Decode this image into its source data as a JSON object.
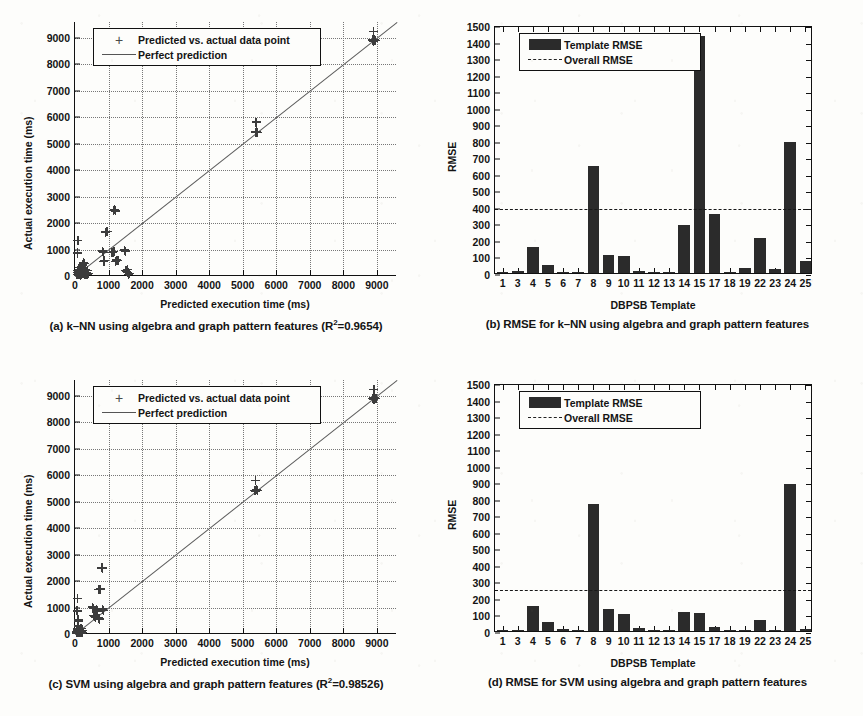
{
  "figure": {
    "panels": [
      {
        "id": "a",
        "caption_prefix": "(a) k–NN using algebra and graph pattern features (R",
        "caption_sup": "2",
        "caption_suffix": "=0.9654)"
      },
      {
        "id": "b",
        "caption": "(b) RMSE for k–NN using algebra and graph pattern features"
      },
      {
        "id": "c",
        "caption_prefix": "(c) SVM using algebra and graph pattern features (R",
        "caption_sup": "2",
        "caption_suffix": "=0.98526)"
      },
      {
        "id": "d",
        "caption": "(d) RMSE for SVM using algebra and graph pattern features"
      }
    ]
  },
  "chart_data": [
    {
      "panel": "a",
      "type": "scatter",
      "title": "k-NN using algebra and graph pattern features",
      "xlabel": "Predicted execution time (ms)",
      "ylabel": "Actual execution time (ms)",
      "xlim": [
        0,
        9600
      ],
      "ylim": [
        0,
        9600
      ],
      "xticks": [
        0,
        1000,
        2000,
        3000,
        4000,
        5000,
        6000,
        7000,
        8000,
        9000
      ],
      "yticks": [
        0,
        1000,
        2000,
        3000,
        4000,
        5000,
        6000,
        7000,
        8000,
        9000
      ],
      "grid": true,
      "r_squared": 0.9654,
      "legend_position": "upper-left",
      "legend": [
        {
          "label": "Predicted vs. actual data point",
          "marker": "plus"
        },
        {
          "label": "Perfect prediction",
          "marker": "line"
        }
      ],
      "reference_line": {
        "name": "Perfect prediction",
        "slope": 1,
        "intercept": 0
      },
      "points": [
        [
          60,
          60
        ],
        [
          70,
          120
        ],
        [
          80,
          200
        ],
        [
          90,
          90
        ],
        [
          100,
          160
        ],
        [
          110,
          40
        ],
        [
          120,
          250
        ],
        [
          130,
          60
        ],
        [
          140,
          330
        ],
        [
          150,
          110
        ],
        [
          160,
          30
        ],
        [
          70,
          860
        ],
        [
          75,
          880
        ],
        [
          80,
          840
        ],
        [
          85,
          1340
        ],
        [
          180,
          200
        ],
        [
          190,
          120
        ],
        [
          200,
          60
        ],
        [
          210,
          300
        ],
        [
          220,
          420
        ],
        [
          240,
          80
        ],
        [
          260,
          150
        ],
        [
          280,
          40
        ],
        [
          300,
          230
        ],
        [
          320,
          70
        ],
        [
          340,
          120
        ],
        [
          360,
          60
        ],
        [
          380,
          210
        ],
        [
          400,
          90
        ],
        [
          260,
          520
        ],
        [
          270,
          480
        ],
        [
          820,
          940
        ],
        [
          840,
          900
        ],
        [
          860,
          560
        ],
        [
          880,
          580
        ],
        [
          900,
          1660
        ],
        [
          930,
          1690
        ],
        [
          960,
          1670
        ],
        [
          1150,
          2480
        ],
        [
          1180,
          2520
        ],
        [
          1200,
          2460
        ],
        [
          1100,
          900
        ],
        [
          1130,
          880
        ],
        [
          1160,
          930
        ],
        [
          1200,
          560
        ],
        [
          1250,
          600
        ],
        [
          1280,
          580
        ],
        [
          1480,
          980
        ],
        [
          1500,
          940
        ],
        [
          1520,
          210
        ],
        [
          1540,
          180
        ],
        [
          1560,
          240
        ],
        [
          1580,
          120
        ],
        [
          1600,
          60
        ],
        [
          1620,
          90
        ],
        [
          5380,
          5440
        ],
        [
          5400,
          5420
        ],
        [
          5420,
          5460
        ],
        [
          5440,
          5430
        ],
        [
          5400,
          5820
        ],
        [
          8860,
          8900
        ],
        [
          8880,
          8930
        ],
        [
          8900,
          8880
        ],
        [
          8920,
          8950
        ],
        [
          8900,
          9230
        ],
        [
          8940,
          8910
        ],
        [
          8960,
          8890
        ]
      ]
    },
    {
      "panel": "b",
      "type": "bar",
      "title": "RMSE for k-NN using algebra and graph pattern features",
      "xlabel": "DBPSB Template",
      "ylabel": "RMSE",
      "ylim": [
        0,
        1500
      ],
      "yticks": [
        0,
        100,
        200,
        300,
        400,
        500,
        600,
        700,
        800,
        900,
        1000,
        1100,
        1200,
        1300,
        1400,
        1500
      ],
      "grid": false,
      "legend_position": "upper-left",
      "legend": [
        {
          "label": "Template RMSE",
          "marker": "bar"
        },
        {
          "label": "Overall RMSE",
          "marker": "dashed-line"
        }
      ],
      "categories": [
        "1",
        "3",
        "4",
        "5",
        "6",
        "7",
        "8",
        "9",
        "10",
        "11",
        "12",
        "13",
        "14",
        "15",
        "17",
        "18",
        "19",
        "22",
        "23",
        "24",
        "25"
      ],
      "values": [
        3,
        10,
        160,
        50,
        8,
        6,
        650,
        108,
        103,
        15,
        2,
        2,
        290,
        1435,
        358,
        3,
        32,
        210,
        22,
        793,
        75
      ],
      "overall_rmse": 400
    },
    {
      "panel": "c",
      "type": "scatter",
      "title": "SVM using algebra and graph pattern features",
      "xlabel": "Predicted execution time (ms)",
      "ylabel": "Actual execution time (ms)",
      "xlim": [
        0,
        9600
      ],
      "ylim": [
        0,
        9600
      ],
      "xticks": [
        0,
        1000,
        2000,
        3000,
        4000,
        5000,
        6000,
        7000,
        8000,
        9000
      ],
      "yticks": [
        0,
        1000,
        2000,
        3000,
        4000,
        5000,
        6000,
        7000,
        8000,
        9000
      ],
      "grid": true,
      "r_squared": 0.98526,
      "legend_position": "upper-left",
      "legend": [
        {
          "label": "Predicted vs. actual data point",
          "marker": "plus"
        },
        {
          "label": "Perfect prediction",
          "marker": "line"
        }
      ],
      "reference_line": {
        "name": "Perfect prediction",
        "slope": 1,
        "intercept": 0
      },
      "points": [
        [
          40,
          40
        ],
        [
          50,
          90
        ],
        [
          60,
          150
        ],
        [
          70,
          60
        ],
        [
          80,
          220
        ],
        [
          90,
          40
        ],
        [
          100,
          300
        ],
        [
          110,
          70
        ],
        [
          120,
          120
        ],
        [
          130,
          180
        ],
        [
          140,
          50
        ],
        [
          60,
          880
        ],
        [
          70,
          860
        ],
        [
          80,
          900
        ],
        [
          75,
          1340
        ],
        [
          90,
          520
        ],
        [
          100,
          560
        ],
        [
          110,
          480
        ],
        [
          150,
          90
        ],
        [
          160,
          140
        ],
        [
          170,
          60
        ],
        [
          180,
          200
        ],
        [
          190,
          100
        ],
        [
          200,
          40
        ],
        [
          210,
          130
        ],
        [
          220,
          70
        ],
        [
          520,
          1020
        ],
        [
          540,
          980
        ],
        [
          560,
          700
        ],
        [
          580,
          680
        ],
        [
          600,
          660
        ],
        [
          620,
          620
        ],
        [
          700,
          1690
        ],
        [
          730,
          1670
        ],
        [
          760,
          1700
        ],
        [
          790,
          2500
        ],
        [
          810,
          2470
        ],
        [
          830,
          2520
        ],
        [
          640,
          940
        ],
        [
          660,
          900
        ],
        [
          680,
          860
        ],
        [
          700,
          600
        ],
        [
          720,
          580
        ],
        [
          740,
          560
        ],
        [
          830,
          940
        ],
        [
          850,
          900
        ],
        [
          5360,
          5430
        ],
        [
          5390,
          5410
        ],
        [
          5420,
          5450
        ],
        [
          5440,
          5420
        ],
        [
          5390,
          5810
        ],
        [
          8870,
          8900
        ],
        [
          8890,
          8930
        ],
        [
          8910,
          8880
        ],
        [
          8930,
          8950
        ],
        [
          8910,
          9230
        ],
        [
          8950,
          8910
        ],
        [
          8970,
          8890
        ]
      ]
    },
    {
      "panel": "d",
      "type": "bar",
      "title": "RMSE for SVM using algebra and graph pattern features",
      "xlabel": "DBPSB Template",
      "ylabel": "RMSE",
      "ylim": [
        0,
        1500
      ],
      "yticks": [
        0,
        100,
        200,
        300,
        400,
        500,
        600,
        700,
        800,
        900,
        1000,
        1100,
        1200,
        1300,
        1400,
        1500
      ],
      "grid": false,
      "legend_position": "upper-left",
      "legend": [
        {
          "label": "Template RMSE",
          "marker": "bar"
        },
        {
          "label": "Overall RMSE",
          "marker": "dashed-line"
        }
      ],
      "categories": [
        "1",
        "3",
        "4",
        "5",
        "6",
        "7",
        "8",
        "9",
        "10",
        "11",
        "12",
        "13",
        "14",
        "15",
        "17",
        "18",
        "19",
        "22",
        "23",
        "24",
        "25"
      ],
      "values": [
        2,
        6,
        152,
        52,
        10,
        5,
        768,
        135,
        105,
        16,
        5,
        8,
        118,
        110,
        22,
        3,
        2,
        65,
        5,
        890,
        15
      ],
      "overall_rmse": 260
    }
  ]
}
